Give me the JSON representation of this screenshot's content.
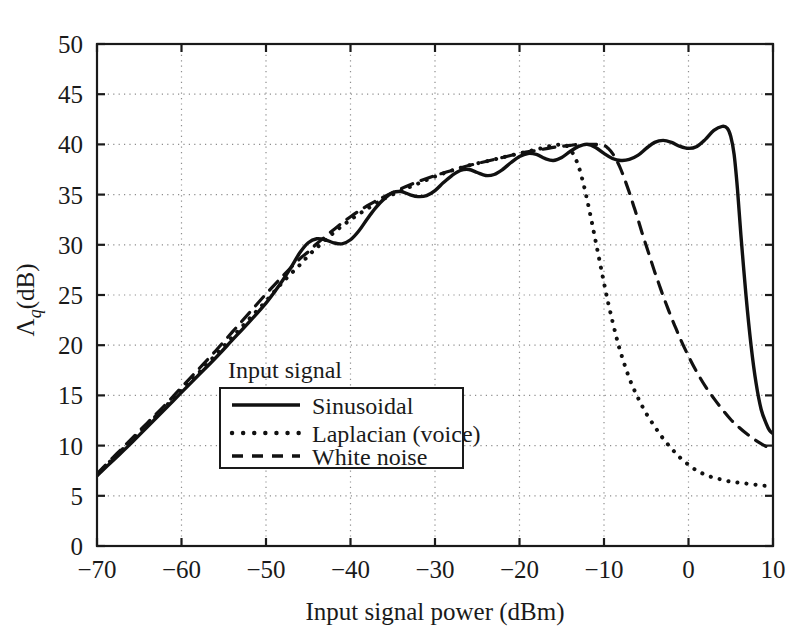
{
  "chart_data": {
    "type": "line",
    "title": "",
    "xlabel": "Input signal power (dBm)",
    "ylabel_parts": {
      "symbol": "Λ",
      "subscript": "q",
      "unit": "(dB)"
    },
    "ylabel": "Λq (dB)",
    "xlim": [
      -70,
      10
    ],
    "ylim": [
      0,
      50
    ],
    "xticks": [
      -70,
      -60,
      -50,
      -40,
      -30,
      -20,
      -10,
      0,
      10
    ],
    "xtick_labels": [
      "−70",
      "−60",
      "−50",
      "−40",
      "−30",
      "−20",
      "−10",
      "0",
      "10"
    ],
    "yticks": [
      0,
      5,
      10,
      15,
      20,
      25,
      30,
      35,
      40,
      45,
      50
    ],
    "ytick_labels": [
      "0",
      "5",
      "10",
      "15",
      "20",
      "25",
      "30",
      "35",
      "40",
      "45",
      "50"
    ],
    "grid": true,
    "grid_style": "dotted",
    "legend_title": "Input signal",
    "legend_position": "lower-center-left",
    "series": [
      {
        "name": "Sinusoidal",
        "style": "solid",
        "points": [
          [
            -70,
            7.0
          ],
          [
            -68,
            8.6
          ],
          [
            -66,
            10.2
          ],
          [
            -64,
            11.9
          ],
          [
            -62,
            13.6
          ],
          [
            -60,
            15.3
          ],
          [
            -58,
            17.0
          ],
          [
            -56,
            18.7
          ],
          [
            -54,
            20.5
          ],
          [
            -52,
            22.3
          ],
          [
            -50,
            24.2
          ],
          [
            -49,
            25.3
          ],
          [
            -48,
            26.5
          ],
          [
            -47,
            27.8
          ],
          [
            -46,
            29.2
          ],
          [
            -45,
            30.2
          ],
          [
            -44,
            30.6
          ],
          [
            -43,
            30.5
          ],
          [
            -42,
            30.2
          ],
          [
            -41,
            30.1
          ],
          [
            -40,
            30.5
          ],
          [
            -39,
            31.4
          ],
          [
            -38,
            32.6
          ],
          [
            -37,
            33.7
          ],
          [
            -36,
            34.6
          ],
          [
            -35,
            35.2
          ],
          [
            -34,
            35.3
          ],
          [
            -33,
            35.0
          ],
          [
            -32,
            34.8
          ],
          [
            -31,
            34.9
          ],
          [
            -30,
            35.4
          ],
          [
            -29,
            36.2
          ],
          [
            -28,
            36.9
          ],
          [
            -27,
            37.4
          ],
          [
            -26,
            37.5
          ],
          [
            -25,
            37.2
          ],
          [
            -24,
            36.9
          ],
          [
            -23,
            37.0
          ],
          [
            -22,
            37.5
          ],
          [
            -21,
            38.2
          ],
          [
            -20,
            38.8
          ],
          [
            -19,
            39.1
          ],
          [
            -18,
            39.0
          ],
          [
            -17,
            38.6
          ],
          [
            -16,
            38.4
          ],
          [
            -15,
            38.7
          ],
          [
            -14,
            39.3
          ],
          [
            -13,
            39.8
          ],
          [
            -12,
            40.0
          ],
          [
            -11,
            39.7
          ],
          [
            -10,
            39.1
          ],
          [
            -9,
            38.6
          ],
          [
            -8,
            38.4
          ],
          [
            -7,
            38.5
          ],
          [
            -6,
            38.9
          ],
          [
            -5,
            39.6
          ],
          [
            -4,
            40.2
          ],
          [
            -3,
            40.4
          ],
          [
            -2,
            40.2
          ],
          [
            -1,
            39.8
          ],
          [
            0,
            39.6
          ],
          [
            1,
            39.8
          ],
          [
            2,
            40.5
          ],
          [
            3,
            41.4
          ],
          [
            4,
            41.8
          ],
          [
            4.6,
            41.6
          ],
          [
            5,
            40.8
          ],
          [
            5.4,
            39.0
          ],
          [
            5.8,
            35.5
          ],
          [
            6.2,
            31.0
          ],
          [
            6.8,
            25.0
          ],
          [
            7.4,
            20.0
          ],
          [
            8,
            16.2
          ],
          [
            8.6,
            13.6
          ],
          [
            9.2,
            12.2
          ],
          [
            9.6,
            11.5
          ],
          [
            10,
            11.2
          ]
        ]
      },
      {
        "name": "Laplacian (voice)",
        "style": "dotted",
        "points": [
          [
            -70,
            7.1
          ],
          [
            -68,
            8.8
          ],
          [
            -66,
            10.4
          ],
          [
            -64,
            12.1
          ],
          [
            -62,
            13.8
          ],
          [
            -60,
            15.5
          ],
          [
            -58,
            17.2
          ],
          [
            -56,
            19.0
          ],
          [
            -54,
            20.8
          ],
          [
            -52,
            22.6
          ],
          [
            -50,
            24.4
          ],
          [
            -48,
            26.3
          ],
          [
            -46,
            28.0
          ],
          [
            -45,
            28.9
          ],
          [
            -44,
            29.7
          ],
          [
            -42,
            31.2
          ],
          [
            -40,
            32.5
          ],
          [
            -38,
            33.6
          ],
          [
            -36,
            34.6
          ],
          [
            -34,
            35.4
          ],
          [
            -32,
            36.1
          ],
          [
            -30,
            36.8
          ],
          [
            -28,
            37.4
          ],
          [
            -26,
            37.9
          ],
          [
            -24,
            38.3
          ],
          [
            -22,
            38.7
          ],
          [
            -20,
            39.1
          ],
          [
            -19,
            39.3
          ],
          [
            -18,
            39.5
          ],
          [
            -17,
            39.7
          ],
          [
            -16,
            39.9
          ],
          [
            -15,
            40.0
          ],
          [
            -14.5,
            39.9
          ],
          [
            -14,
            39.5
          ],
          [
            -13.5,
            38.8
          ],
          [
            -13,
            37.8
          ],
          [
            -12.5,
            36.3
          ],
          [
            -12,
            34.5
          ],
          [
            -11.5,
            32.5
          ],
          [
            -11,
            30.4
          ],
          [
            -10.5,
            28.3
          ],
          [
            -10,
            26.2
          ],
          [
            -9.5,
            24.2
          ],
          [
            -9,
            22.4
          ],
          [
            -8.5,
            20.7
          ],
          [
            -8,
            19.2
          ],
          [
            -7,
            16.7
          ],
          [
            -6,
            14.8
          ],
          [
            -5,
            13.2
          ],
          [
            -4,
            11.9
          ],
          [
            -3,
            10.7
          ],
          [
            -2,
            9.7
          ],
          [
            -1,
            8.8
          ],
          [
            0,
            8.1
          ],
          [
            1,
            7.5
          ],
          [
            2,
            7.1
          ],
          [
            3,
            6.8
          ],
          [
            4,
            6.6
          ],
          [
            5,
            6.4
          ],
          [
            6,
            6.3
          ],
          [
            7,
            6.2
          ],
          [
            8,
            6.1
          ],
          [
            9,
            6.0
          ],
          [
            10,
            6.0
          ]
        ]
      },
      {
        "name": "White noise",
        "style": "dashed",
        "points": [
          [
            -70,
            7.2
          ],
          [
            -68,
            8.9
          ],
          [
            -66,
            10.6
          ],
          [
            -64,
            12.3
          ],
          [
            -62,
            14.0
          ],
          [
            -60,
            15.8
          ],
          [
            -58,
            17.6
          ],
          [
            -56,
            19.4
          ],
          [
            -54,
            21.3
          ],
          [
            -52,
            23.2
          ],
          [
            -50,
            25.1
          ],
          [
            -48,
            26.9
          ],
          [
            -46,
            28.6
          ],
          [
            -45,
            29.3
          ],
          [
            -44,
            30.1
          ],
          [
            -42,
            31.5
          ],
          [
            -40,
            32.8
          ],
          [
            -38,
            33.9
          ],
          [
            -36,
            34.8
          ],
          [
            -34,
            35.6
          ],
          [
            -32,
            36.3
          ],
          [
            -30,
            36.9
          ],
          [
            -28,
            37.4
          ],
          [
            -26,
            37.9
          ],
          [
            -24,
            38.3
          ],
          [
            -22,
            38.7
          ],
          [
            -20,
            39.1
          ],
          [
            -18,
            39.4
          ],
          [
            -16,
            39.7
          ],
          [
            -15,
            39.8
          ],
          [
            -14,
            39.9
          ],
          [
            -13,
            40.0
          ],
          [
            -12,
            40.0
          ],
          [
            -11,
            40.0
          ],
          [
            -10,
            39.9
          ],
          [
            -9.5,
            39.6
          ],
          [
            -9,
            39.1
          ],
          [
            -8.5,
            38.4
          ],
          [
            -8,
            37.5
          ],
          [
            -7.5,
            36.4
          ],
          [
            -7,
            35.2
          ],
          [
            -6.5,
            33.9
          ],
          [
            -6,
            32.6
          ],
          [
            -5.5,
            31.2
          ],
          [
            -5,
            29.9
          ],
          [
            -4.5,
            28.6
          ],
          [
            -4,
            27.3
          ],
          [
            -3.5,
            26.1
          ],
          [
            -3,
            24.9
          ],
          [
            -2.5,
            23.8
          ],
          [
            -2,
            22.7
          ],
          [
            -1.5,
            21.7
          ],
          [
            -1,
            20.7
          ],
          [
            0,
            18.9
          ],
          [
            1,
            17.3
          ],
          [
            2,
            15.9
          ],
          [
            3,
            14.7
          ],
          [
            4,
            13.6
          ],
          [
            5,
            12.6
          ],
          [
            6,
            11.8
          ],
          [
            7,
            11.1
          ],
          [
            8,
            10.5
          ],
          [
            9,
            10.0
          ],
          [
            10,
            9.5
          ]
        ]
      }
    ]
  }
}
